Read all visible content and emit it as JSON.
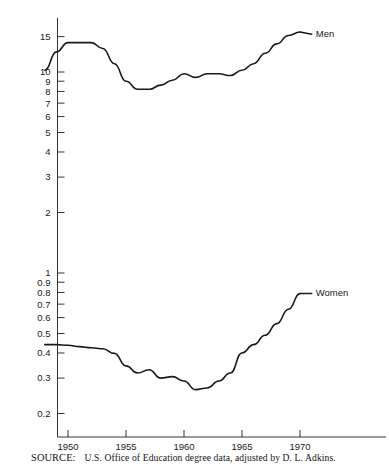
{
  "figure": {
    "source_prefix": "SOURCE:",
    "source_text": "U.S. Office of Education degree data, adjusted by D. L. Adkins.",
    "line_color": "#1a1a1a",
    "axis_color": "#333333",
    "background": "#ffffff"
  },
  "chart_data": {
    "type": "line",
    "title": "",
    "subtitle": "",
    "xlabel": "",
    "ylabel": "",
    "yscale": "log",
    "xlim": [
      1948,
      1971
    ],
    "ylim": [
      0.15,
      21
    ],
    "grid": false,
    "legend": "inline-right-end-labels",
    "xticks": [
      1950,
      1955,
      1960,
      1965,
      1970
    ],
    "xtick_labels": [
      "1950",
      "1955",
      "1960",
      "1965",
      "1970"
    ],
    "yticks": [
      0.2,
      0.3,
      0.4,
      0.5,
      0.6,
      0.7,
      0.8,
      0.9,
      1,
      2,
      3,
      4,
      5,
      6,
      7,
      8,
      9,
      10,
      15,
      20
    ],
    "ytick_labels": [
      "0.2",
      "0.3",
      "0.4",
      "0.5",
      "0.6",
      "0.7",
      "0.8",
      "0.9",
      "1",
      "2",
      "3",
      "4",
      "5",
      "6",
      "7",
      "8",
      "9",
      "10",
      "15",
      "20"
    ],
    "annotations": [
      {
        "text": "Men",
        "x": 1971.1,
        "y": 15.6
      },
      {
        "text": "Women",
        "x": 1971.1,
        "y": 0.8
      }
    ],
    "series": [
      {
        "name": "Men",
        "label": "Men",
        "color": "#1a1a1a",
        "x": [
          1948,
          1949,
          1950,
          1951,
          1952,
          1953,
          1954,
          1955,
          1956,
          1957,
          1958,
          1959,
          1960,
          1961,
          1962,
          1963,
          1964,
          1965,
          1966,
          1967,
          1968,
          1969,
          1970
        ],
        "values": [
          10.2,
          12.6,
          14.0,
          14.0,
          14.0,
          13.1,
          11.0,
          9.0,
          8.2,
          8.2,
          8.6,
          9.1,
          9.8,
          9.4,
          9.8,
          9.8,
          9.6,
          10.2,
          11.0,
          12.4,
          13.8,
          15.2,
          15.8
        ]
      },
      {
        "name": "Women",
        "label": "Women",
        "color": "#1a1a1a",
        "x": [
          1948,
          1949,
          1950,
          1951,
          1952,
          1953,
          1954,
          1955,
          1956,
          1957,
          1958,
          1959,
          1960,
          1961,
          1962,
          1963,
          1964,
          1965,
          1966,
          1967,
          1968,
          1969,
          1970
        ],
        "values": [
          0.44,
          0.44,
          0.437,
          0.43,
          0.425,
          0.42,
          0.398,
          0.345,
          0.318,
          0.33,
          0.3,
          0.305,
          0.29,
          0.263,
          0.268,
          0.29,
          0.318,
          0.4,
          0.44,
          0.49,
          0.56,
          0.66,
          0.79
        ]
      }
    ]
  }
}
